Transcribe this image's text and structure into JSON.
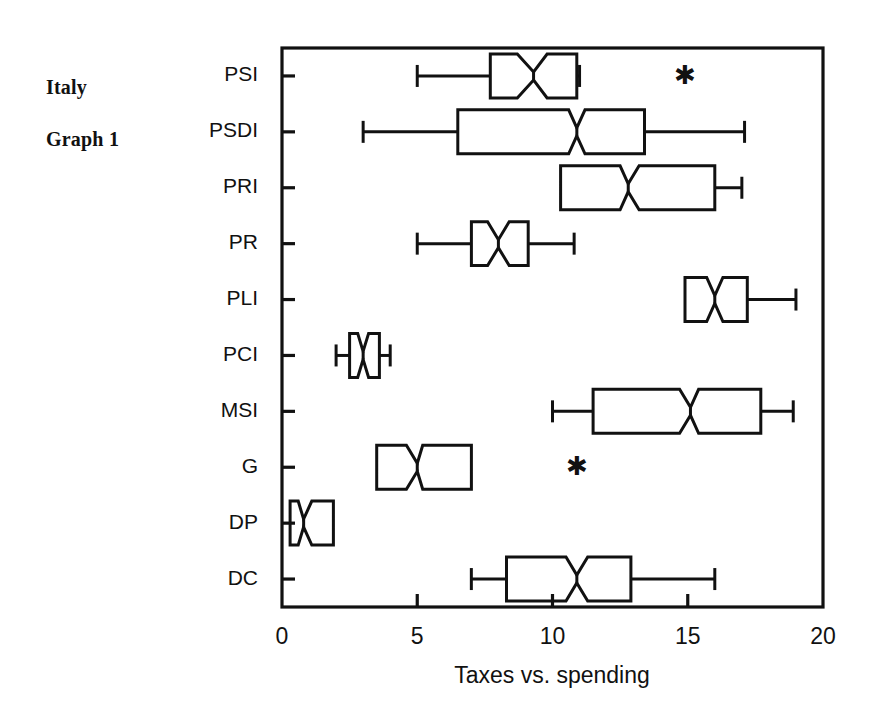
{
  "figure": {
    "corner_title_lines": [
      "Italy",
      "Graph 1"
    ]
  },
  "chart_data": {
    "type": "box",
    "orientation": "horizontal",
    "notched": true,
    "title": "",
    "xlabel": "Taxes vs. spending",
    "ylabel": "",
    "xlim": [
      0,
      20
    ],
    "xticks": [
      0,
      5,
      10,
      15,
      20
    ],
    "xtick_labels": [
      "0",
      "5",
      "10",
      "15",
      "20"
    ],
    "grid": false,
    "legend": null,
    "categories": [
      "PSI",
      "PSDI",
      "PRI",
      "PR",
      "PLI",
      "PCI",
      "MSI",
      "G",
      "DP",
      "DC"
    ],
    "boxes": [
      {
        "label": "PSI",
        "whisker_low": 5.0,
        "q1": 7.7,
        "median": 9.3,
        "q3": 10.9,
        "whisker_high": 11.0,
        "notch_low": 8.7,
        "notch_high": 9.8,
        "outliers": [
          14.9
        ]
      },
      {
        "label": "PSDI",
        "whisker_low": 3.0,
        "q1": 6.5,
        "median": 10.9,
        "q3": 13.4,
        "whisker_high": 17.1,
        "notch_low": 10.6,
        "notch_high": 11.2,
        "outliers": []
      },
      {
        "label": "PRI",
        "whisker_low": 10.3,
        "q1": 10.3,
        "median": 12.8,
        "q3": 16.0,
        "whisker_high": 17.0,
        "notch_low": 12.5,
        "notch_high": 13.2,
        "outliers": []
      },
      {
        "label": "PR",
        "whisker_low": 5.0,
        "q1": 7.0,
        "median": 8.0,
        "q3": 9.1,
        "whisker_high": 10.8,
        "notch_low": 7.6,
        "notch_high": 8.4,
        "outliers": []
      },
      {
        "label": "PLI",
        "whisker_low": 14.9,
        "q1": 14.9,
        "median": 16.0,
        "q3": 17.2,
        "whisker_high": 19.0,
        "notch_low": 15.7,
        "notch_high": 16.3,
        "outliers": []
      },
      {
        "label": "PCI",
        "whisker_low": 2.0,
        "q1": 2.5,
        "median": 3.0,
        "q3": 3.6,
        "whisker_high": 4.0,
        "notch_low": 2.8,
        "notch_high": 3.2,
        "outliers": []
      },
      {
        "label": "MSI",
        "whisker_low": 10.0,
        "q1": 11.5,
        "median": 15.1,
        "q3": 17.7,
        "whisker_high": 18.9,
        "notch_low": 14.7,
        "notch_high": 15.4,
        "outliers": []
      },
      {
        "label": "G",
        "whisker_low": 3.5,
        "q1": 3.5,
        "median": 5.0,
        "q3": 7.0,
        "whisker_high": 7.0,
        "notch_low": 4.6,
        "notch_high": 5.2,
        "outliers": [
          10.9
        ]
      },
      {
        "label": "DP",
        "whisker_low": 0.3,
        "q1": 0.3,
        "median": 0.8,
        "q3": 1.9,
        "whisker_high": 1.9,
        "notch_low": 0.6,
        "notch_high": 1.1,
        "outliers": []
      },
      {
        "label": "DC",
        "whisker_low": 7.0,
        "q1": 8.3,
        "median": 10.9,
        "q3": 12.9,
        "whisker_high": 16.0,
        "notch_low": 10.5,
        "notch_high": 11.3,
        "outliers": []
      }
    ]
  },
  "colors": {
    "ink": "#111111",
    "background": "#ffffff"
  }
}
